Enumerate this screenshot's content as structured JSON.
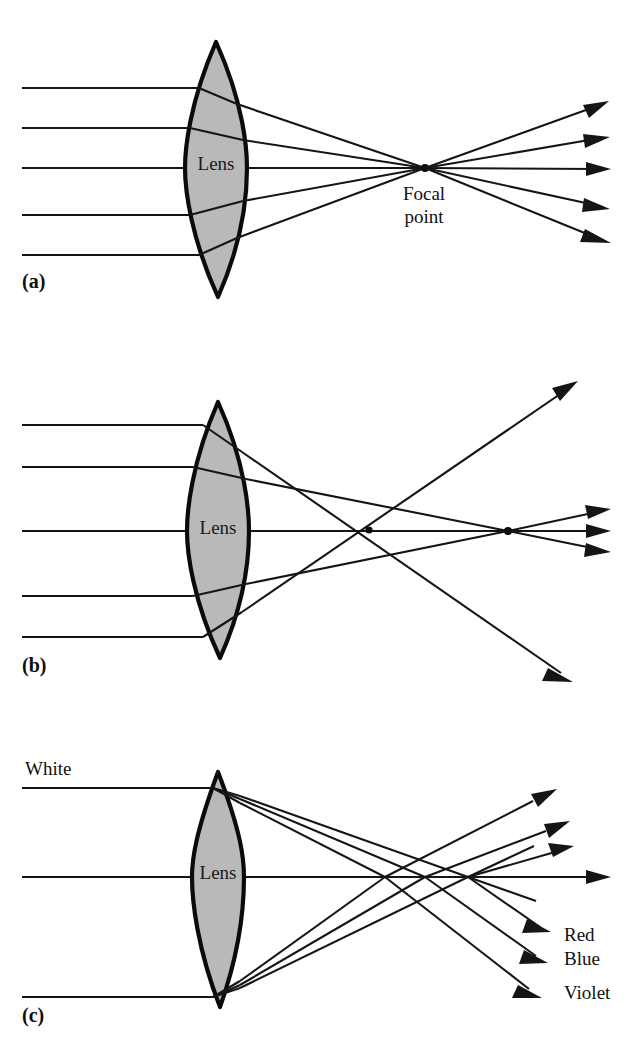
{
  "figure": {
    "background_color": "#ffffff",
    "ink_color": "#151515",
    "lens_fill_color": "#b9b9b9",
    "lens_outline_color": "#0b0b0b"
  },
  "panels": [
    {
      "id": "a",
      "label": "(a)",
      "label_x": 22,
      "label_y": 288,
      "lens_label": "Lens",
      "lens_label_x": 216,
      "lens_label_y": 163,
      "concept": "ideal-lens-single-focal-point",
      "focal_label_line1": "Focal",
      "focal_label_line2": "point",
      "focal_label_x": 424,
      "focal_label_y1": 197,
      "focal_label_y2": 220,
      "focal_point_x": 425,
      "focal_point_y": 168,
      "axis_y": 168,
      "lens": {
        "top_y": 42,
        "bottom_y": 297,
        "center_x": 216,
        "half_width": 31,
        "left_edge_x": 185,
        "right_edge_x": 247
      },
      "incoming_ray_y": [
        88,
        128,
        168,
        215,
        255
      ],
      "exit_ray_y": [
        103,
        137,
        170,
        207,
        240
      ],
      "ray_start_x": 22,
      "ray_end_x": 612
    },
    {
      "id": "b",
      "label": "(b)",
      "label_x": 22,
      "label_y": 672,
      "lens_label": "Lens",
      "lens_label_x": 218,
      "lens_label_y": 527,
      "concept": "spherical-aberration",
      "axis_y": 531,
      "near_cross_x": 369,
      "near_cross_y": 530,
      "far_focal_x": 508,
      "far_focal_y": 531,
      "lens": {
        "top_y": 402,
        "bottom_y": 658,
        "center_x": 218,
        "half_width": 31,
        "left_edge_x": 187,
        "right_edge_x": 249
      },
      "incoming_ray_y": [
        425,
        467,
        531,
        596,
        637
      ],
      "ray_start_x": 22,
      "outer_upper_arrow": {
        "x": 572,
        "y": 382
      },
      "outer_lower_arrow": {
        "x": 566,
        "y": 666
      },
      "inner_exit_arrow_y": [
        512,
        531,
        549
      ],
      "inner_exit_arrow_x": 612
    },
    {
      "id": "c",
      "label": "(c)",
      "label_x": 22,
      "label_y": 1022,
      "lens_label": "Lens",
      "lens_label_x": 218,
      "lens_label_y": 872,
      "concept": "chromatic-aberration",
      "axis_y": 877,
      "source_label": "White",
      "source_label_x": 25,
      "source_label_y": 775,
      "lens": {
        "top_y": 772,
        "bottom_y": 1007,
        "center_x": 218,
        "half_width": 26,
        "left_edge_x": 192,
        "right_edge_x": 244
      },
      "incoming_ray_y": [
        788,
        877,
        997
      ],
      "ray_start_x": 22,
      "colors": [
        {
          "name": "Red",
          "label": "Red",
          "label_x": 564,
          "label_y": 940,
          "focal_x": 468,
          "focal_y": 877,
          "up_arrow_x": 545,
          "up_arrow_y": 793,
          "down_arrow_x": 548,
          "down_arrow_y": 932
        },
        {
          "name": "Blue",
          "label": "Blue",
          "label_x": 564,
          "label_y": 964,
          "focal_x": 425,
          "focal_y": 877,
          "up_arrow_x": 558,
          "up_arrow_y": 824,
          "down_arrow_x": 545,
          "down_arrow_y": 962
        },
        {
          "name": "Violet",
          "label": "Violet",
          "label_x": 564,
          "label_y": 998,
          "focal_x": 385,
          "focal_y": 877,
          "up_arrow_x": 562,
          "up_arrow_y": 847,
          "down_arrow_x": 540,
          "down_arrow_y": 995
        }
      ],
      "axis_arrow_x": 612
    }
  ]
}
